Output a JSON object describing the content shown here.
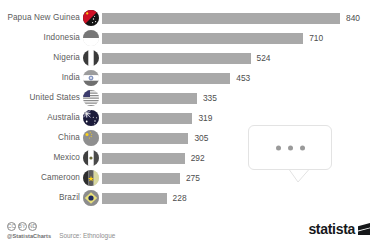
{
  "chart_data": {
    "type": "bar",
    "orientation": "horizontal",
    "title": "",
    "subtitle": "",
    "xlabel": "",
    "ylabel": "",
    "categories": [
      "Papua New Guinea",
      "Indonesia",
      "Nigeria",
      "India",
      "United States",
      "Australia",
      "China",
      "Mexico",
      "Cameroon",
      "Brazil"
    ],
    "values": [
      840,
      710,
      524,
      453,
      335,
      319,
      305,
      292,
      275,
      228
    ],
    "value_labels": [
      "840",
      "710",
      "524",
      "453",
      "335",
      "319",
      "305",
      "292",
      "275",
      "228"
    ],
    "xlim": [
      0,
      840
    ],
    "grid": false,
    "legend": null,
    "bar_color": "#a9a9a9",
    "label_color": "#5b5b5b"
  },
  "rows": [
    {
      "label": "Papua New Guinea",
      "value": 840,
      "value_label": "840",
      "flag": "flag-papua-new-guinea"
    },
    {
      "label": "Indonesia",
      "value": 710,
      "value_label": "710",
      "flag": "flag-indonesia"
    },
    {
      "label": "Nigeria",
      "value": 524,
      "value_label": "524",
      "flag": "flag-nigeria"
    },
    {
      "label": "India",
      "value": 453,
      "value_label": "453",
      "flag": "flag-india"
    },
    {
      "label": "United States",
      "value": 335,
      "value_label": "335",
      "flag": "flag-united-states"
    },
    {
      "label": "Australia",
      "value": 319,
      "value_label": "319",
      "flag": "flag-australia"
    },
    {
      "label": "China",
      "value": 305,
      "value_label": "305",
      "flag": "flag-china"
    },
    {
      "label": "Mexico",
      "value": 292,
      "value_label": "292",
      "flag": "flag-mexico"
    },
    {
      "label": "Cameroon",
      "value": 275,
      "value_label": "275",
      "flag": "flag-cameroon"
    },
    {
      "label": "Brazil",
      "value": 228,
      "value_label": "228",
      "flag": "flag-brazil"
    }
  ],
  "bubble": {
    "dots": [
      "dot",
      "dot",
      "dot"
    ]
  },
  "footer": {
    "cc_badges": [
      "CC",
      "BY",
      "ND"
    ],
    "handle": "@StatistaCharts",
    "source": "Source: Ethnologue"
  },
  "brand": {
    "text": "statista"
  }
}
